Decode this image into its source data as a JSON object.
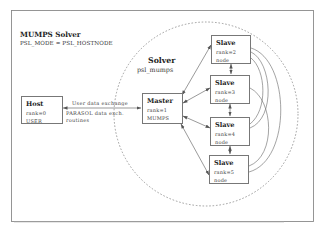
{
  "diagram": {
    "title": "MUMPS Solver",
    "mode_line": "PSL_MODE = PSL_HOSTNODE",
    "solver_region": {
      "title": "Solver",
      "subtitle": "psl_mumps"
    },
    "nodes": {
      "host": {
        "title": "Host",
        "rank": "rank=0",
        "role": "USER"
      },
      "master": {
        "title": "Master",
        "rank": "rank=1",
        "role": "MUMPS"
      },
      "slaves": [
        {
          "title": "Slave",
          "rank": "rank=2",
          "role": "node"
        },
        {
          "title": "Slave",
          "rank": "rank=3",
          "role": "node"
        },
        {
          "title": "Slave",
          "rank": "rank=4",
          "role": "node"
        },
        {
          "title": "Slave",
          "rank": "rank=5",
          "role": "node"
        }
      ]
    },
    "edges": {
      "host_master_top": "User data exchange",
      "host_master_bottom_1": "PARASOL data exch.",
      "host_master_bottom_2": "routines"
    },
    "colors": {
      "frame": "#8a8a8a",
      "box_border": "#777777",
      "arrow": "#555555",
      "dashed_circle": "#888888"
    }
  }
}
